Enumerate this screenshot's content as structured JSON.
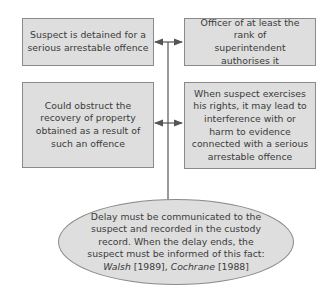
{
  "diagram": {
    "boxes": [
      {
        "id": "suspect-detained",
        "text": "Suspect is detained for a serious arrestable offence"
      },
      {
        "id": "officer-authorises",
        "text": "Officer of at least the rank of superintendent authorises it"
      },
      {
        "id": "obstruct-recovery",
        "text": "Could obstruct the recovery of property obtained as a result of such an offence"
      },
      {
        "id": "interference-evidence",
        "text": "When suspect exercises his rights, it may lead to interference with or harm to evidence connected with a serious arrestable offence"
      }
    ],
    "ellipse": {
      "text_main": "Delay must be communicated to the suspect and recorded in the custody record. When the delay ends, the suspect must be informed of this fact:",
      "case1_name": "Walsh",
      "case1_year": "[1989],",
      "case2_name": "Cochrane",
      "case2_year": "[1988]"
    },
    "colors": {
      "fill": "#dedede",
      "border": "#8a8a8a",
      "line": "#555555"
    }
  }
}
